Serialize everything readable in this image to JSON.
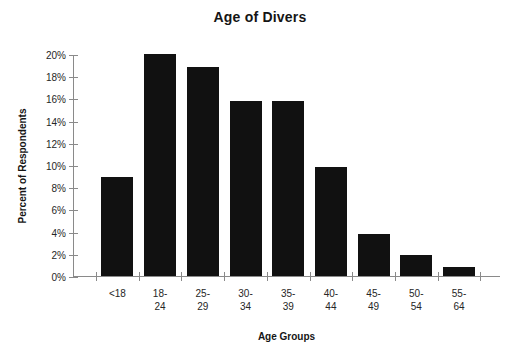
{
  "chart_data": {
    "type": "bar",
    "title": "Age of Divers",
    "xlabel": "Age Groups",
    "ylabel": "Percent of Respondents",
    "categories": [
      "<18",
      "18-24",
      "25-29",
      "30-34",
      "35-39",
      "40-44",
      "45-49",
      "50-54",
      "55-64"
    ],
    "category_lines": [
      [
        "<18"
      ],
      [
        "18-",
        "24"
      ],
      [
        "25-",
        "29"
      ],
      [
        "30-",
        "34"
      ],
      [
        "35-",
        "39"
      ],
      [
        "40-",
        "44"
      ],
      [
        "45-",
        "49"
      ],
      [
        "50-",
        "54"
      ],
      [
        "55-",
        "64"
      ]
    ],
    "values": [
      8.9,
      20.0,
      18.8,
      15.8,
      15.8,
      9.8,
      3.8,
      1.9,
      0.8
    ],
    "ylim": [
      0,
      20
    ],
    "ytick_values": [
      0,
      2,
      4,
      6,
      8,
      10,
      12,
      14,
      16,
      18,
      20
    ],
    "ytick_labels": [
      "0%",
      "2%",
      "4%",
      "6%",
      "8%",
      "10%",
      "12%",
      "14%",
      "16%",
      "18%",
      "20%"
    ],
    "grid": false,
    "legend": false,
    "bar_color": "#111111",
    "axis_color": "#8a8a8a",
    "text_color": "#262626"
  }
}
